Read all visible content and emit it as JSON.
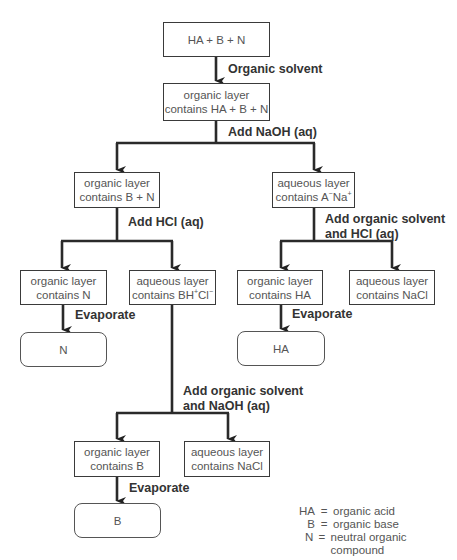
{
  "diagram": {
    "nodes": {
      "start": {
        "text": "HA + B + N"
      },
      "org_all": {
        "line1": "organic layer",
        "line2": "contains HA + B + N"
      },
      "org_bn": {
        "line1": "organic layer",
        "line2": "contains B + N"
      },
      "aq_ana": {
        "line1": "aqueous layer",
        "line2_pre": "contains A",
        "sup1": "−",
        "mid": "Na",
        "sup2": "+"
      },
      "org_n": {
        "line1": "organic layer",
        "line2": "contains N"
      },
      "aq_bhcl": {
        "line1": "aqueous layer",
        "line2_pre": "contains BH",
        "sup1": "+",
        "mid": "Cl",
        "sup2": "−"
      },
      "org_ha": {
        "line1": "organic layer",
        "line2": "contains HA"
      },
      "aq_nacl_1": {
        "line1": "aqueous layer",
        "line2": "contains NaCl"
      },
      "prod_n": {
        "text": "N"
      },
      "prod_ha": {
        "text": "HA"
      },
      "org_b": {
        "line1": "organic layer",
        "line2": "contains B"
      },
      "aq_nacl_2": {
        "line1": "aqueous layer",
        "line2": "contains NaCl"
      },
      "prod_b": {
        "text": "B"
      }
    },
    "steps": {
      "s1": "Organic solvent",
      "s2": "Add NaOH (aq)",
      "s3": "Add HCl (aq)",
      "s4_line1": "Add organic solvent",
      "s4_line2": "and HCl (aq)",
      "s5": "Evaporate",
      "s6": "Evaporate",
      "s7_line1": "Add organic solvent",
      "s7_line2": "and NaOH (aq)",
      "s8": "Evaporate"
    },
    "legend": [
      {
        "key": "HA",
        "value": "organic acid"
      },
      {
        "key": "B",
        "value": "organic base"
      },
      {
        "key": "N",
        "value": "neutral organic compound"
      }
    ],
    "legend_eq": "=",
    "colors": {
      "line": "#2a2a2a",
      "box_border": "#3a3a3a",
      "text": "#555555"
    }
  }
}
